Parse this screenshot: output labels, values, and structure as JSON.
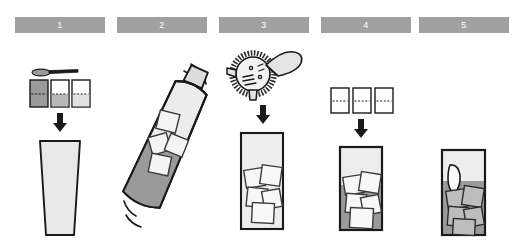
{
  "infographic": {
    "title": "Cocktail preparation steps",
    "background_color": "#ffffff",
    "banner_color": "#a0a0a0",
    "banner_text_color": "#ffffff",
    "outline_color": "#1a1a1a",
    "glass_fill_light": "#eeeeee",
    "liquid_fill_dark": "#8c8c8c",
    "ice_fill": "#f2f2f2",
    "step_count": 5
  },
  "steps": [
    {
      "number": "1",
      "name": "measure-and-pour",
      "description": "Measure ingredients with bar spoon and jiggers, pour into mixing glass",
      "icons": [
        "bar-spoon-icon",
        "measure-glass-icon",
        "down-arrow-icon",
        "tapered-glass-icon"
      ],
      "measures": [
        {
          "label": "full",
          "fill_level": 100,
          "shade": "#9a9a9a"
        },
        {
          "label": "half",
          "fill_level": 55,
          "shade": "#b8b8b8"
        },
        {
          "label": "splash",
          "fill_level": 28,
          "shade": "#dcdcdc"
        }
      ]
    },
    {
      "number": "2",
      "name": "shake",
      "description": "Shake the cocktail shaker filled with ice",
      "icons": [
        "cocktail-shaker-icon",
        "ice-cube-icon",
        "motion-lines-icon"
      ],
      "ice_cubes": 4
    },
    {
      "number": "3",
      "name": "strain",
      "description": "Strain the mixture with a Hawthorne strainer into an ice-filled glass",
      "icons": [
        "hawthorne-strainer-icon",
        "down-arrow-icon",
        "highball-glass-icon",
        "ice-cube-icon"
      ],
      "ice_cubes": 5
    },
    {
      "number": "4",
      "name": "top-up",
      "description": "Top up with measured mixers into the glass",
      "icons": [
        "measure-glass-icon",
        "down-arrow-icon",
        "highball-glass-icon",
        "ice-cube-icon"
      ],
      "measures": [
        {
          "label": "empty",
          "fill_level": 0,
          "shade": "#ffffff"
        },
        {
          "label": "empty",
          "fill_level": 0,
          "shade": "#ffffff"
        },
        {
          "label": "empty",
          "fill_level": 0,
          "shade": "#ffffff"
        }
      ],
      "ice_cubes": 5
    },
    {
      "number": "5",
      "name": "garnish-and-serve",
      "description": "Garnish with a citrus wedge and serve",
      "icons": [
        "highball-glass-icon",
        "ice-cube-icon",
        "citrus-wedge-icon"
      ],
      "ice_cubes": 5
    }
  ]
}
